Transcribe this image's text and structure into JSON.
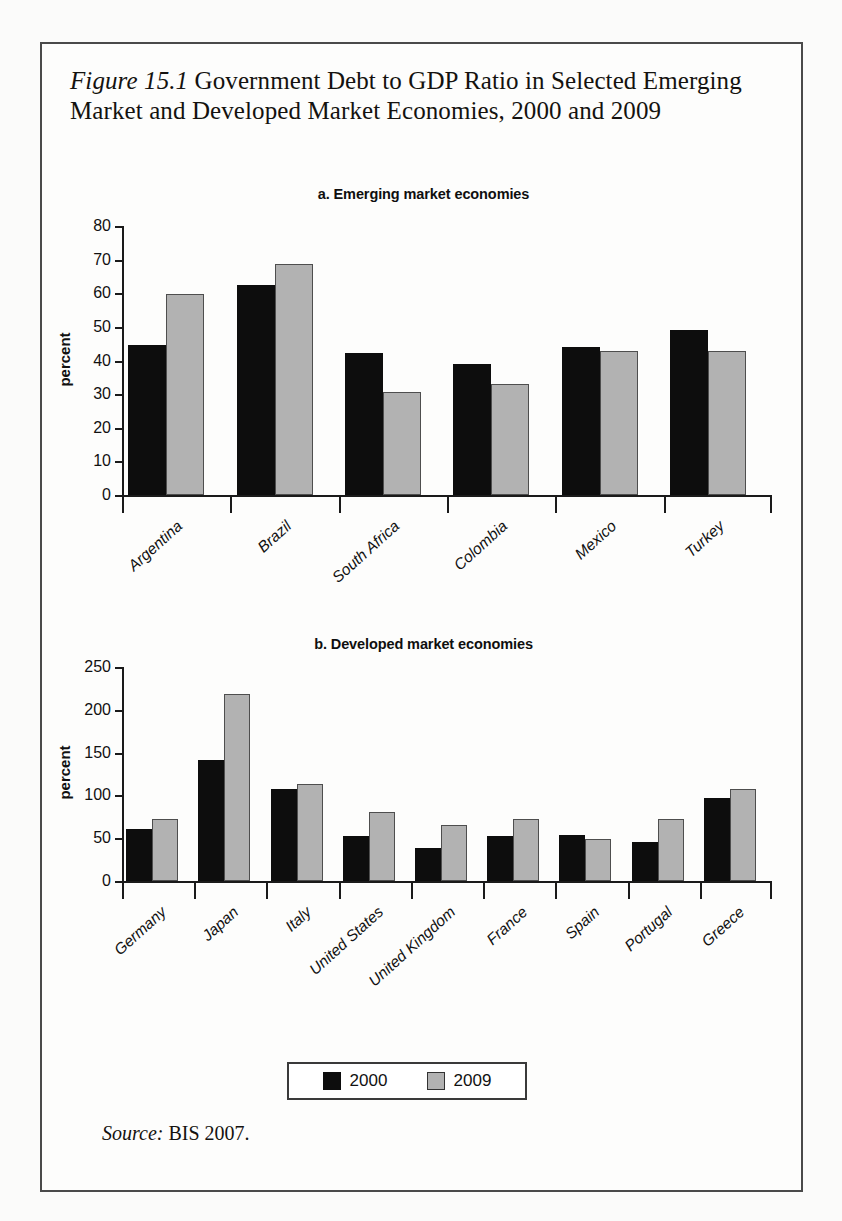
{
  "figure": {
    "number_label": "Figure 15.1",
    "title_text": " Government Debt to GDP Ratio in Selected Emerging Market and Developed Market Economies, 2000 and 2009",
    "source_word": "Source:",
    "source_text": " BIS 2007."
  },
  "legend": {
    "items": [
      {
        "label": "2000",
        "color": "#0d0d0d"
      },
      {
        "label": "2009",
        "color": "#b2b2b2"
      }
    ]
  },
  "chart_data": [
    {
      "type": "bar",
      "title": "a. Emerging market economies",
      "xlabel": "",
      "ylabel": "percent",
      "ylim": [
        0,
        80
      ],
      "yticks": [
        0,
        10,
        20,
        30,
        40,
        50,
        60,
        70,
        80
      ],
      "grid": false,
      "legend_position": "bottom",
      "categories": [
        "Argentina",
        "Brazil",
        "South Africa",
        "Colombia",
        "Mexico",
        "Turkey"
      ],
      "series": [
        {
          "name": "2000",
          "color": "#0d0d0d",
          "values": [
            44.5,
            62.5,
            42.3,
            39.0,
            44.0,
            49.0
          ]
        },
        {
          "name": "2009",
          "color": "#b2b2b2",
          "values": [
            59.8,
            68.7,
            30.5,
            33.0,
            42.8,
            42.8
          ]
        }
      ]
    },
    {
      "type": "bar",
      "title": "b. Developed market economies",
      "xlabel": "",
      "ylabel": "percent",
      "ylim": [
        0,
        250
      ],
      "yticks": [
        0,
        50,
        100,
        150,
        200,
        250
      ],
      "grid": false,
      "legend_position": "bottom",
      "categories": [
        "Germany",
        "Japan",
        "Italy",
        "United States",
        "United Kingdom",
        "France",
        "Spain",
        "Portugal",
        "Greece"
      ],
      "series": [
        {
          "name": "2000",
          "color": "#0d0d0d",
          "values": [
            61,
            141,
            108,
            52,
            38,
            53,
            54,
            45,
            97
          ]
        },
        {
          "name": "2009",
          "color": "#b2b2b2",
          "values": [
            73,
            218,
            113,
            81,
            65,
            73,
            49,
            72,
            107
          ]
        }
      ]
    }
  ]
}
